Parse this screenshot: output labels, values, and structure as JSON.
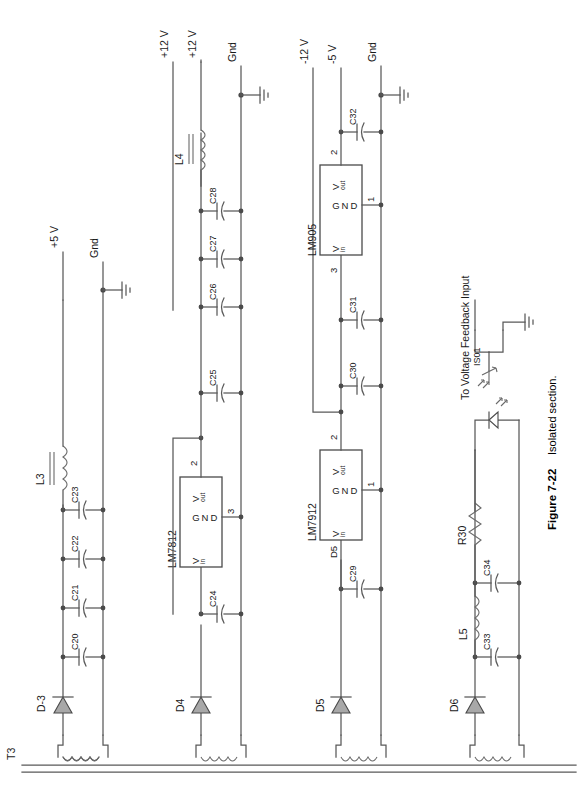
{
  "figure": {
    "number": "Figure 7-22",
    "caption": "Isolated section.",
    "transformer": "T3"
  },
  "rails": [
    {
      "id": "rail-p5",
      "label": "+5 V"
    },
    {
      "id": "rail-gnd1",
      "label": "Gnd"
    },
    {
      "id": "rail-p12a",
      "label": "+12 V"
    },
    {
      "id": "rail-p12b",
      "label": "+12 V"
    },
    {
      "id": "rail-gnd2",
      "label": "Gnd"
    },
    {
      "id": "rail-m12",
      "label": "-12 V"
    },
    {
      "id": "rail-m5",
      "label": "-5 V"
    },
    {
      "id": "rail-gnd3",
      "label": "Gnd"
    }
  ],
  "sections": {
    "s1": {
      "name": "+5 V section",
      "diode": "D-3",
      "inductor": "L3",
      "capacitors": [
        "C20",
        "C21",
        "C22",
        "C23"
      ],
      "out_label": "+5 V",
      "gnd_label": "Gnd"
    },
    "s2": {
      "name": "+12 V section",
      "diode": "D4",
      "regulator": "LM7812",
      "reg_pin_in": "3",
      "reg_pin_out": "2",
      "reg_pin_gnd": "3",
      "inductor": "L4",
      "capacitors": [
        "C24",
        "C25",
        "C26",
        "C27",
        "C28"
      ],
      "out_label": "+12 V",
      "gnd_label": "Gnd"
    },
    "s3": {
      "name": "-12 V / -5 V section",
      "diode": "D5",
      "regulator_a": "LM7912",
      "regulator_b": "LM905",
      "capacitors": [
        "C29",
        "C30",
        "C31",
        "C32"
      ],
      "out_label_a": "-12 V",
      "out_label_b": "-5 V",
      "gnd_label": "Gnd"
    },
    "s4": {
      "name": "Feedback section",
      "diode": "D6",
      "inductor": "L5",
      "resistor": "R30",
      "capacitors": [
        "C33",
        "C34"
      ],
      "optocoupler": "IS01",
      "feedback_note": "To Voltage Feedback Input"
    }
  },
  "pin_text": {
    "vin": "V",
    "vin_sub": "in",
    "vout": "V",
    "vout_sub": "out",
    "gnd_g": "G",
    "gnd_n": "N",
    "gnd_d": "D"
  },
  "colors": {
    "wire": "#595959",
    "text": "#1a1a1a",
    "diode_fill": "#a8a8a8",
    "background": "#ffffff"
  }
}
